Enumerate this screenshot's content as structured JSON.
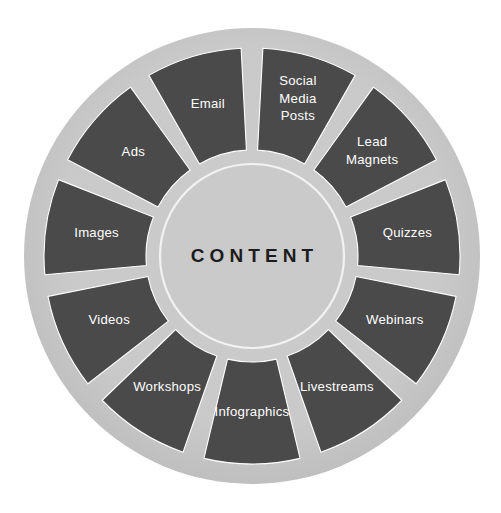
{
  "diagram": {
    "hub_label": "CONTENT",
    "colors": {
      "background": "#ffffff",
      "ring": "#c8c8c8",
      "segment": "#4a4a4a",
      "segment_text": "#ffffff",
      "hub_fill": "#cacaca",
      "hub_outline": "#f2f2f2",
      "hub_text": "#1c1c1c",
      "divider": "#ffffff"
    },
    "geometry": {
      "center_x": 252,
      "center_y": 256,
      "outer_radius": 228,
      "segment_outer_radius": 208,
      "segment_inner_radius": 106,
      "hub_radius": 92,
      "segment_count": 11,
      "gap_degrees": 6
    },
    "segments": [
      {
        "id": "social-media-posts",
        "label": "Social Media Posts",
        "lines": [
          "Social",
          "Media",
          "Posts"
        ]
      },
      {
        "id": "lead-magnets",
        "label": "Lead Magnets",
        "lines": [
          "Lead",
          "Magnets"
        ]
      },
      {
        "id": "quizzes",
        "label": "Quizzes",
        "lines": [
          "Quizzes"
        ]
      },
      {
        "id": "webinars",
        "label": "Webinars",
        "lines": [
          "Webinars"
        ]
      },
      {
        "id": "livestreams",
        "label": "Livestreams",
        "lines": [
          "Livestreams"
        ]
      },
      {
        "id": "infographics",
        "label": "Infographics",
        "lines": [
          "Infographics"
        ]
      },
      {
        "id": "workshops",
        "label": "Workshops",
        "lines": [
          "Workshops"
        ]
      },
      {
        "id": "videos",
        "label": "Videos",
        "lines": [
          "Videos"
        ]
      },
      {
        "id": "images",
        "label": "Images",
        "lines": [
          "Images"
        ]
      },
      {
        "id": "ads",
        "label": "Ads",
        "lines": [
          "Ads"
        ]
      },
      {
        "id": "email",
        "label": "Email",
        "lines": [
          "Email"
        ]
      }
    ]
  }
}
